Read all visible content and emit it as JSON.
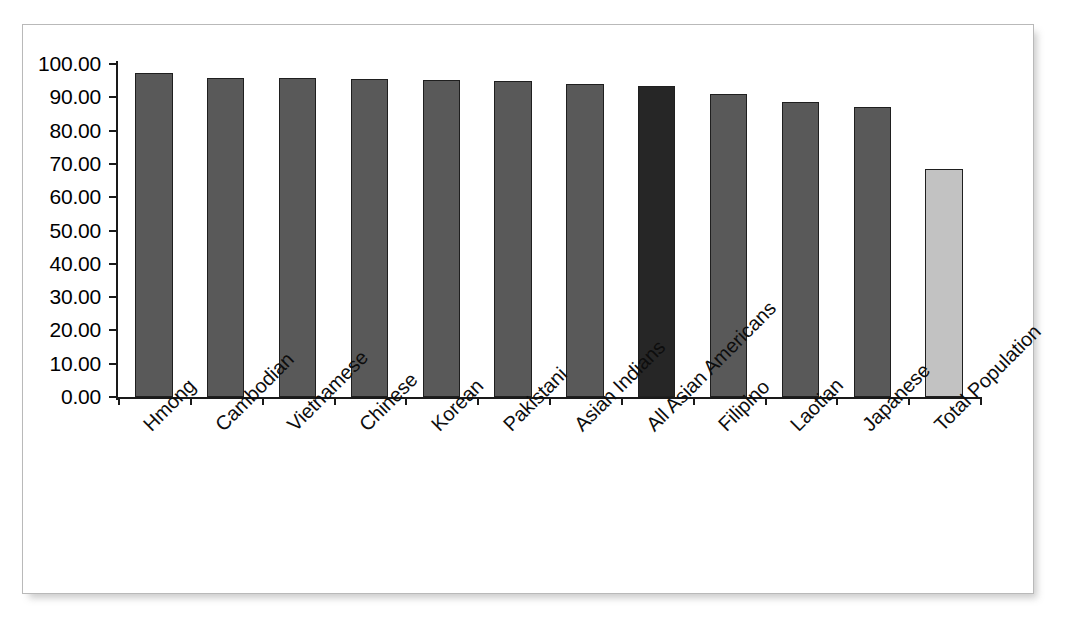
{
  "clipped_caption": "",
  "chart_data": {
    "type": "bar",
    "title": "",
    "subtitle": "",
    "xlabel": "",
    "ylabel": "",
    "ylim": [
      0,
      100
    ],
    "ytick_step": 10,
    "grid": false,
    "legend": "none",
    "yticks": [
      "100.00",
      "90.00",
      "80.00",
      "70.00",
      "60.00",
      "50.00",
      "40.00",
      "30.00",
      "20.00",
      "10.00",
      "0.00"
    ],
    "categories": [
      "Hmong",
      "Cambodian",
      "Vietnamese",
      "Chinese",
      "Korean",
      "Pakistani",
      "Asian Indians",
      "All Asian Americans",
      "Filipino",
      "Laotian",
      "Japanese",
      "Total Population"
    ],
    "values": [
      97.3,
      95.8,
      95.8,
      95.5,
      95.2,
      94.9,
      94.1,
      93.3,
      90.9,
      88.6,
      87.2,
      68.6
    ],
    "bar_styles": [
      "main",
      "main",
      "main",
      "main",
      "main",
      "main",
      "main",
      "accent",
      "main",
      "main",
      "main",
      "light"
    ],
    "colors": {
      "bar_main": "#595959",
      "bar_accent": "#262626",
      "bar_light": "#c2c2c2",
      "bar_outline": "#1f1f1f",
      "axis": "#1a1a1a",
      "frame_border": "#b9b9b9",
      "plot_background": "#ffffff",
      "text": "#000000"
    }
  }
}
